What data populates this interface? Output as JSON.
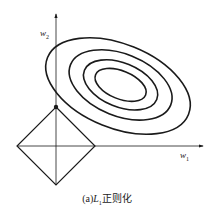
{
  "figure": {
    "caption_prefix": "(a)",
    "caption_symbol": "L",
    "caption_subscript": "1",
    "caption_text": "正则化"
  },
  "axes": {
    "x_label": "w",
    "x_subscript": "1",
    "y_label": "w",
    "y_subscript": "2"
  },
  "colors": {
    "stroke": "#1a1a1a",
    "background": "#ffffff"
  }
}
